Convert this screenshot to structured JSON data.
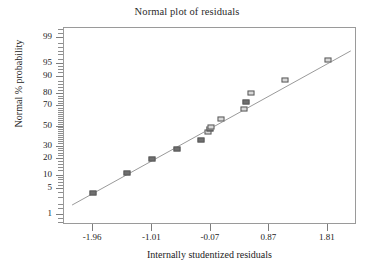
{
  "chart_data": {
    "type": "scatter",
    "title": "Normal plot of residuals",
    "xlabel": "Internally studentized residuals",
    "ylabel": "Normal % probability",
    "grid": false,
    "legend": null,
    "xlim": [
      -2.43,
      2.28
    ],
    "ylim": [
      0.5,
      99.5
    ],
    "yscale": "normal-probability",
    "xticks": [
      "-1.96",
      "-1.01",
      "-0.07",
      "0.87",
      "1.81"
    ],
    "xtick_values": [
      -1.96,
      -1.01,
      -0.07,
      0.87,
      1.81
    ],
    "yticks": [
      "99",
      "95",
      "90",
      "80",
      "70",
      "50",
      "30",
      "20",
      "10",
      "5",
      "1"
    ],
    "ytick_values": [
      99,
      95,
      90,
      80,
      70,
      50,
      30,
      20,
      10,
      5,
      1
    ],
    "series": [
      {
        "name": "residuals",
        "x": [
          -1.96,
          -1.42,
          -1.01,
          -0.62,
          -0.22,
          -0.12,
          -0.09,
          -0.07,
          0.1,
          0.46,
          0.5,
          0.58,
          1.12,
          1.81
        ],
        "y": [
          4,
          11,
          20,
          28,
          36,
          44,
          47,
          50,
          58,
          68,
          74,
          81,
          89,
          96
        ],
        "marker": "square",
        "marker_fills": [
          "dark",
          "dark",
          "dark",
          "dark",
          "dark",
          "light",
          "dark",
          "light",
          "light",
          "light",
          "dark",
          "light",
          "light",
          "light"
        ]
      }
    ],
    "reference_line": {
      "name": "normal reference line",
      "x": [
        -2.3,
        2.18
      ],
      "y": [
        2.0,
        97.6
      ],
      "color": "#9a9a9a"
    }
  },
  "colors": {
    "frame": "#9a9a9a",
    "marker_dark": "#6f6f6f",
    "marker_light": "#d8d8d8",
    "marker_edge": "#5a5a5a",
    "text": "#1c1c1c",
    "background": "#ffffff"
  }
}
